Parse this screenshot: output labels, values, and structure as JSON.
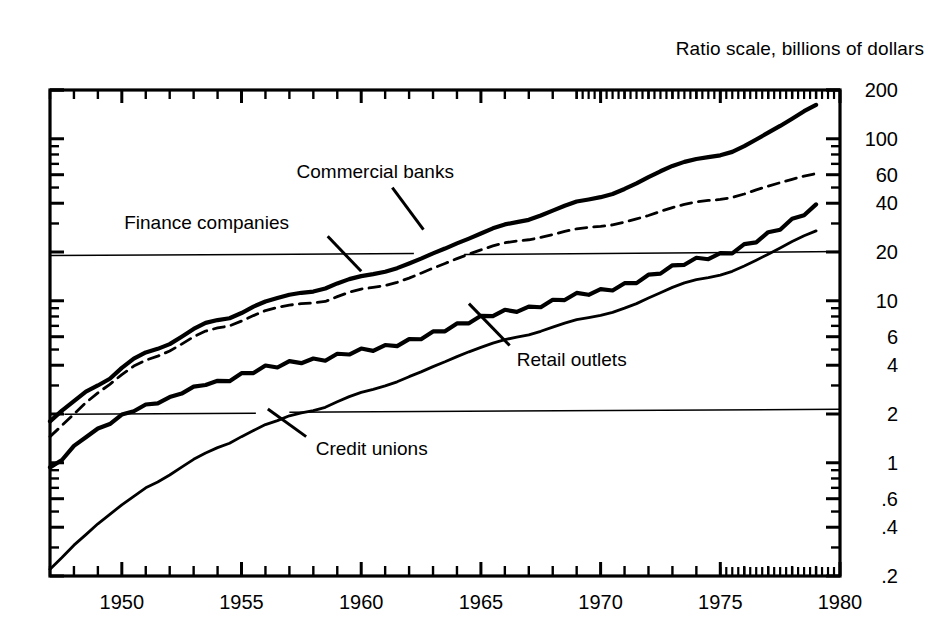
{
  "header": {
    "title": "Ratio scale, billions of dollars"
  },
  "chart_data": {
    "type": "line",
    "title": "Ratio scale, billions of dollars",
    "subtitle": "",
    "xlabel": "",
    "ylabel": "",
    "scale": "log",
    "grid": false,
    "legend_position": "inline-annotations",
    "xlim": [
      1947,
      1980
    ],
    "ylim": [
      0.2,
      200
    ],
    "xticks": [
      1950,
      1955,
      1960,
      1965,
      1970,
      1975,
      1980
    ],
    "xtick_labels": [
      "1950",
      "1955",
      "1960",
      "1965",
      "1970",
      "1975",
      "1980"
    ],
    "yticks": [
      200,
      100,
      60,
      40,
      20,
      10,
      6,
      4,
      2,
      1,
      0.6,
      0.4,
      0.2
    ],
    "ytick_labels": [
      "200",
      "100",
      "60",
      "40",
      "20",
      "10",
      "6",
      "4",
      "2",
      "1",
      ".6",
      ".4",
      ".2"
    ],
    "ytick_side": "right",
    "reference_lines": [
      {
        "value": 19,
        "label": "",
        "style": "thin-solid"
      },
      {
        "value": 2.05,
        "label": "",
        "style": "thin-solid"
      }
    ],
    "annotations": [
      {
        "text": "Commercial banks",
        "x": 1958.6,
        "y": 62,
        "series": "Commercial banks"
      },
      {
        "text": "Finance companies",
        "x": 1952.4,
        "y": 30,
        "series": "Finance companies"
      },
      {
        "text": "Retail outlets",
        "x": 1965.4,
        "y": 4.6,
        "series": "Retail outlets"
      },
      {
        "text": "Credit unions",
        "x": 1957.0,
        "y": 1.35,
        "series": "Credit unions"
      }
    ],
    "series": [
      {
        "name": "Commercial banks",
        "style": "thick-solid",
        "color": "#000000",
        "x": [
          1947.0,
          1947.5,
          1948.0,
          1948.5,
          1949.0,
          1949.5,
          1950.0,
          1950.5,
          1951.0,
          1951.5,
          1952.0,
          1952.5,
          1953.0,
          1953.5,
          1954.0,
          1954.5,
          1955.0,
          1955.5,
          1956.0,
          1956.5,
          1957.0,
          1957.5,
          1958.0,
          1958.5,
          1959.0,
          1959.5,
          1960.0,
          1960.5,
          1961.0,
          1961.5,
          1962.0,
          1962.5,
          1963.0,
          1963.5,
          1964.0,
          1964.5,
          1965.0,
          1965.5,
          1966.0,
          1966.5,
          1967.0,
          1967.5,
          1968.0,
          1968.5,
          1969.0,
          1969.5,
          1970.0,
          1970.5,
          1971.0,
          1971.5,
          1972.0,
          1972.5,
          1973.0,
          1973.5,
          1974.0,
          1974.5,
          1975.0,
          1975.5,
          1976.0,
          1976.5,
          1977.0,
          1977.5,
          1978.0,
          1978.5,
          1979.0
        ],
        "values": [
          1.8,
          2.1,
          2.4,
          2.75,
          3.0,
          3.3,
          3.85,
          4.4,
          4.8,
          5.05,
          5.4,
          6.0,
          6.7,
          7.3,
          7.6,
          7.8,
          8.4,
          9.2,
          9.9,
          10.4,
          10.9,
          11.2,
          11.4,
          11.9,
          12.8,
          13.6,
          14.2,
          14.6,
          15.1,
          15.9,
          17.0,
          18.2,
          19.6,
          21.0,
          22.6,
          24.2,
          26.0,
          28.0,
          29.6,
          30.6,
          31.6,
          33.6,
          36.0,
          38.6,
          41.0,
          42.2,
          43.6,
          45.6,
          49.0,
          53.0,
          58.0,
          63.0,
          68.0,
          72.0,
          75.0,
          77.0,
          79.0,
          83.0,
          90.0,
          99.0,
          109.0,
          120.0,
          133.0,
          148.0,
          162.0
        ]
      },
      {
        "name": "Finance companies",
        "style": "dashed",
        "color": "#000000",
        "x": [
          1947.0,
          1947.5,
          1948.0,
          1948.5,
          1949.0,
          1949.5,
          1950.0,
          1950.5,
          1951.0,
          1951.5,
          1952.0,
          1952.5,
          1953.0,
          1953.5,
          1954.0,
          1954.5,
          1955.0,
          1955.5,
          1956.0,
          1956.5,
          1957.0,
          1957.5,
          1958.0,
          1958.5,
          1959.0,
          1959.5,
          1960.0,
          1960.5,
          1961.0,
          1961.5,
          1962.0,
          1962.5,
          1963.0,
          1963.5,
          1964.0,
          1964.5,
          1965.0,
          1965.5,
          1966.0,
          1966.5,
          1967.0,
          1967.5,
          1968.0,
          1968.5,
          1969.0,
          1969.5,
          1970.0,
          1970.5,
          1971.0,
          1971.5,
          1972.0,
          1972.5,
          1973.0,
          1973.5,
          1974.0,
          1974.5,
          1975.0,
          1975.5,
          1976.0,
          1976.5,
          1977.0,
          1977.5,
          1978.0,
          1978.5,
          1979.0
        ],
        "values": [
          1.45,
          1.7,
          2.0,
          2.35,
          2.7,
          3.05,
          3.5,
          3.95,
          4.3,
          4.55,
          4.9,
          5.4,
          6.0,
          6.5,
          6.8,
          7.0,
          7.5,
          8.1,
          8.7,
          9.1,
          9.4,
          9.6,
          9.7,
          9.9,
          10.6,
          11.3,
          11.8,
          12.1,
          12.4,
          13.0,
          13.8,
          14.8,
          15.9,
          17.0,
          18.2,
          19.4,
          20.6,
          21.8,
          22.8,
          23.4,
          23.8,
          24.6,
          25.6,
          26.8,
          27.8,
          28.4,
          28.8,
          29.4,
          30.6,
          32.0,
          33.6,
          35.6,
          37.6,
          39.4,
          40.8,
          41.6,
          42.2,
          43.4,
          45.6,
          48.4,
          51.0,
          53.6,
          56.2,
          58.8,
          61.0
        ]
      },
      {
        "name": "Retail outlets",
        "style": "thick-solid-seasonal",
        "color": "#000000",
        "x": [
          1947.0,
          1947.5,
          1948.0,
          1948.5,
          1949.0,
          1949.5,
          1950.0,
          1950.5,
          1951.0,
          1951.5,
          1952.0,
          1952.5,
          1953.0,
          1953.5,
          1954.0,
          1954.5,
          1955.0,
          1955.5,
          1956.0,
          1956.5,
          1957.0,
          1957.5,
          1958.0,
          1958.5,
          1959.0,
          1959.5,
          1960.0,
          1960.5,
          1961.0,
          1961.5,
          1962.0,
          1962.5,
          1963.0,
          1963.5,
          1964.0,
          1964.5,
          1965.0,
          1965.5,
          1966.0,
          1966.5,
          1967.0,
          1967.5,
          1968.0,
          1968.5,
          1969.0,
          1969.5,
          1970.0,
          1970.5,
          1971.0,
          1971.5,
          1972.0,
          1972.5,
          1973.0,
          1973.5,
          1974.0,
          1974.5,
          1975.0,
          1975.5,
          1976.0,
          1976.5,
          1977.0,
          1977.5,
          1978.0,
          1978.5,
          1979.0
        ],
        "values": [
          0.92,
          1.05,
          1.25,
          1.45,
          1.6,
          1.75,
          1.95,
          2.1,
          2.25,
          2.35,
          2.5,
          2.7,
          2.9,
          3.05,
          3.15,
          3.25,
          3.45,
          3.65,
          3.85,
          3.95,
          4.1,
          4.2,
          4.25,
          4.35,
          4.55,
          4.75,
          4.9,
          5.0,
          5.15,
          5.35,
          5.6,
          5.9,
          6.25,
          6.6,
          7.0,
          7.4,
          7.8,
          8.2,
          8.5,
          8.7,
          8.9,
          9.3,
          9.8,
          10.3,
          10.8,
          11.1,
          11.4,
          11.8,
          12.4,
          13.1,
          14.0,
          15.0,
          16.0,
          17.0,
          17.8,
          18.4,
          19.0,
          20.0,
          21.6,
          23.4,
          25.6,
          28.0,
          31.0,
          34.4,
          38.0
        ]
      },
      {
        "name": "Credit unions",
        "style": "thin-solid",
        "color": "#000000",
        "x": [
          1947.0,
          1947.5,
          1948.0,
          1948.5,
          1949.0,
          1949.5,
          1950.0,
          1950.5,
          1951.0,
          1951.5,
          1952.0,
          1952.5,
          1953.0,
          1953.5,
          1954.0,
          1954.5,
          1955.0,
          1955.5,
          1956.0,
          1956.5,
          1957.0,
          1957.5,
          1958.0,
          1958.5,
          1959.0,
          1959.5,
          1960.0,
          1960.5,
          1961.0,
          1961.5,
          1962.0,
          1962.5,
          1963.0,
          1963.5,
          1964.0,
          1964.5,
          1965.0,
          1965.5,
          1966.0,
          1966.5,
          1967.0,
          1967.5,
          1968.0,
          1968.5,
          1969.0,
          1969.5,
          1970.0,
          1970.5,
          1971.0,
          1971.5,
          1972.0,
          1972.5,
          1973.0,
          1973.5,
          1974.0,
          1974.5,
          1975.0,
          1975.5,
          1976.0,
          1976.5,
          1977.0,
          1977.5,
          1978.0,
          1978.5,
          1979.0
        ],
        "values": [
          0.22,
          0.26,
          0.31,
          0.36,
          0.42,
          0.48,
          0.55,
          0.62,
          0.7,
          0.76,
          0.84,
          0.94,
          1.05,
          1.15,
          1.24,
          1.32,
          1.45,
          1.58,
          1.72,
          1.82,
          1.95,
          2.03,
          2.1,
          2.2,
          2.38,
          2.56,
          2.72,
          2.84,
          2.98,
          3.16,
          3.4,
          3.64,
          3.92,
          4.2,
          4.52,
          4.84,
          5.16,
          5.48,
          5.76,
          5.96,
          6.16,
          6.48,
          6.88,
          7.28,
          7.64,
          7.88,
          8.12,
          8.48,
          9.0,
          9.6,
          10.4,
          11.2,
          12.1,
          12.9,
          13.5,
          13.9,
          14.4,
          15.2,
          16.4,
          17.8,
          19.4,
          21.2,
          23.2,
          25.2,
          27.0
        ]
      }
    ]
  }
}
